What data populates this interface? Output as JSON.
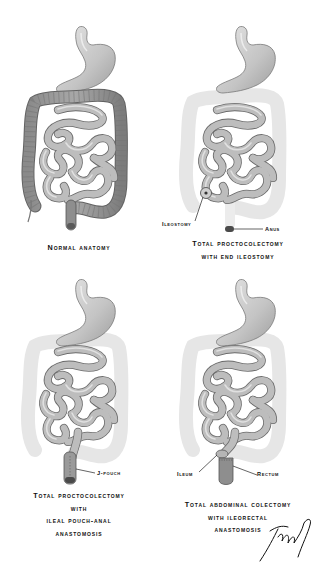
{
  "figure": {
    "panels": [
      {
        "id": "normal-anatomy",
        "caption_lines": [
          "Normal anatomy"
        ],
        "labels": []
      },
      {
        "id": "total-proctocolectomy-end-ileostomy",
        "caption_lines": [
          "Total proctocolectomy",
          "with end ileostomy"
        ],
        "labels": [
          "Ileostomy",
          "Anus"
        ]
      },
      {
        "id": "total-proctocolectomy-ipaa",
        "caption_lines": [
          "Total proctocolectomy",
          "with",
          "ileal pouch-anal",
          "anastomosis"
        ],
        "labels": [
          "J-pouch"
        ]
      },
      {
        "id": "total-abdominal-colectomy-ira",
        "caption_lines": [
          "Total abdominal colectomy",
          "with ileorectal",
          "anastomosis"
        ],
        "labels": [
          "Ileum",
          "Rectum"
        ]
      }
    ],
    "colors": {
      "organ_fill": "#c8c8c8",
      "organ_stroke": "#6e6e6e",
      "colon_fill": "#9a9a9a",
      "removed_colon_ghost": "#e4e4e4",
      "stoma_dark": "#4a4a4a",
      "text": "#111111"
    }
  }
}
